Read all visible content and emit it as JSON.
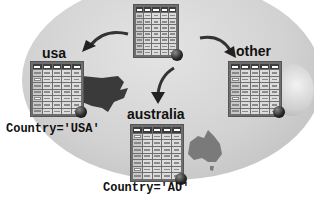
{
  "diagram": {
    "type": "table-partitioning",
    "background": {
      "shape": "globe",
      "color": "#d2d2d2"
    },
    "source_table": {
      "label": ""
    },
    "partitions": [
      {
        "name": "usa",
        "label": "usa",
        "condition": "Country='USA'",
        "region_icon": "north-america"
      },
      {
        "name": "australia",
        "label": "australia",
        "condition": "Country='AU'",
        "region_icon": "australia"
      },
      {
        "name": "other",
        "label": "other",
        "condition": "",
        "region_icon": "globe"
      }
    ],
    "arrows": [
      {
        "from": "source_table",
        "to": "usa"
      },
      {
        "from": "source_table",
        "to": "australia"
      },
      {
        "from": "source_table",
        "to": "other"
      }
    ],
    "colors": {
      "table_frame": "#6e6e6e",
      "table_header": "#3d3d3d",
      "cell": "#dcdcdc",
      "arrow": "#333333"
    }
  }
}
